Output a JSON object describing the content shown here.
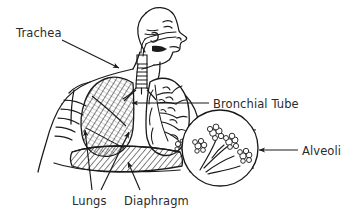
{
  "figure": {
    "background_color": "#ffffff",
    "line_color": "#1a1a1a",
    "text_color": "#2b2b2b"
  },
  "labels": {
    "trachea": "Trachea",
    "bronchial_tube": "Bronchial Tube",
    "alveoli": "Alveoli",
    "lungs": "Lungs",
    "diaphragm": "Diaphragm"
  },
  "parts": [
    {
      "name": "trachea",
      "label": "Trachea",
      "label_position": {
        "x": 16,
        "y": 26
      },
      "pointer_from": {
        "x": 62,
        "y": 40
      },
      "pointer_to": {
        "x": 119,
        "y": 68
      },
      "arrow": true
    },
    {
      "name": "bronchial-tube",
      "label": "Bronchial Tube",
      "label_position": {
        "x": 213,
        "y": 97
      },
      "pointer_from": {
        "x": 209,
        "y": 103
      },
      "pointer_to": {
        "x": 131,
        "y": 103
      },
      "arrow": true
    },
    {
      "name": "alveoli",
      "label": "Alveoli",
      "label_position": {
        "x": 302,
        "y": 144
      },
      "pointer_from": {
        "x": 298,
        "y": 150
      },
      "pointer_to": {
        "x": 258,
        "y": 150
      },
      "arrow": true
    },
    {
      "name": "lungs",
      "label": "Lungs",
      "label_position": {
        "x": 72,
        "y": 194
      },
      "pointer_from": {
        "x": 92,
        "y": 190
      },
      "pointer_to": {
        "x": 85,
        "y": 129
      },
      "arrow": true,
      "second_pointer_from": {
        "x": 101,
        "y": 190
      },
      "second_pointer_to": {
        "x": 129,
        "y": 131
      }
    },
    {
      "name": "diaphragm",
      "label": "Diaphragm",
      "label_position": {
        "x": 124,
        "y": 194
      },
      "pointer_from": {
        "x": 140,
        "y": 190
      },
      "pointer_to": {
        "x": 128,
        "y": 161
      },
      "arrow": true
    }
  ],
  "inset": {
    "name": "alveoli-magnification",
    "shape": "circle",
    "center": {
      "x": 220,
      "y": 148
    },
    "radius": 38,
    "cluster_count": 4,
    "connector": "cone from lower right lung to inset circle"
  }
}
